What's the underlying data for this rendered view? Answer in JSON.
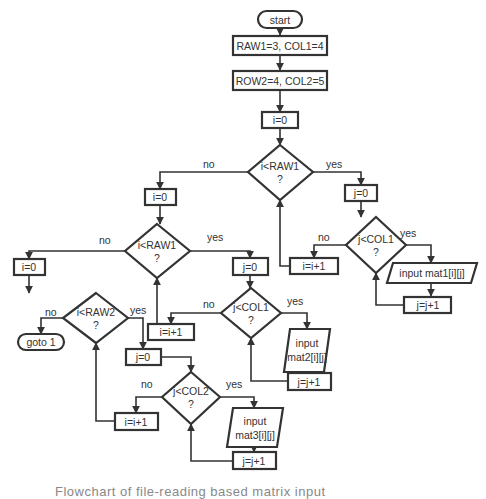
{
  "nodes": {
    "start": "start",
    "init1": "RAW1=3, COL1=4",
    "init2": "ROW2=4, COL2=5",
    "i0_a": "i=0",
    "cond_a": [
      "i<RAW1",
      "?"
    ],
    "j0_a": "j=0",
    "cond_a2": [
      "j<COL1",
      "?"
    ],
    "input_a": "input mat1[i][j]",
    "jinc_a": "j=j+1",
    "iinc_a": "i=i+1",
    "i0_b": "i=0",
    "cond_b": [
      "i<RAW1",
      "?"
    ],
    "j0_b": "j=0",
    "cond_b2": [
      "j<COL1",
      "?"
    ],
    "input_b": [
      "input",
      "mat2[i][j]"
    ],
    "jinc_b": "j=j+1",
    "iinc_b": "i=i+1",
    "i0_c": "i=0",
    "cond_c": [
      "i<RAW2",
      "?"
    ],
    "goto": "goto 1",
    "j0_c": "j=0",
    "cond_c2": [
      "j<COL2",
      "?"
    ],
    "input_c": [
      "input",
      "mat3[i][j]"
    ],
    "jinc_c": "j=j+1",
    "iinc_c": "i=i+1"
  },
  "labels": {
    "yes": "yes",
    "no": "no"
  },
  "caption": "Flowchart of file-reading based matrix input"
}
